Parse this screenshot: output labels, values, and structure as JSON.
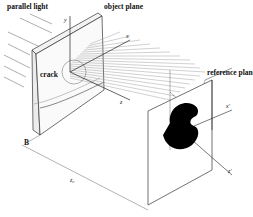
{
  "diagram": {
    "type": "optical setup (caustic / shadow optics)",
    "labels": {
      "parallel_light": "parallel light",
      "object_plane": "object plane",
      "reference_plane": "reference plane",
      "crack": "crack",
      "B": "B",
      "z0": "z₀"
    },
    "axes": {
      "object": {
        "x": "x",
        "y": "y",
        "z": "z"
      },
      "reference": {
        "x": "x'",
        "y": "y'",
        "z": "z'"
      }
    },
    "colors": {
      "line": "#333333",
      "hatch": "#8a8a8a",
      "caustic": "#000000",
      "background": "#ffffff"
    }
  }
}
